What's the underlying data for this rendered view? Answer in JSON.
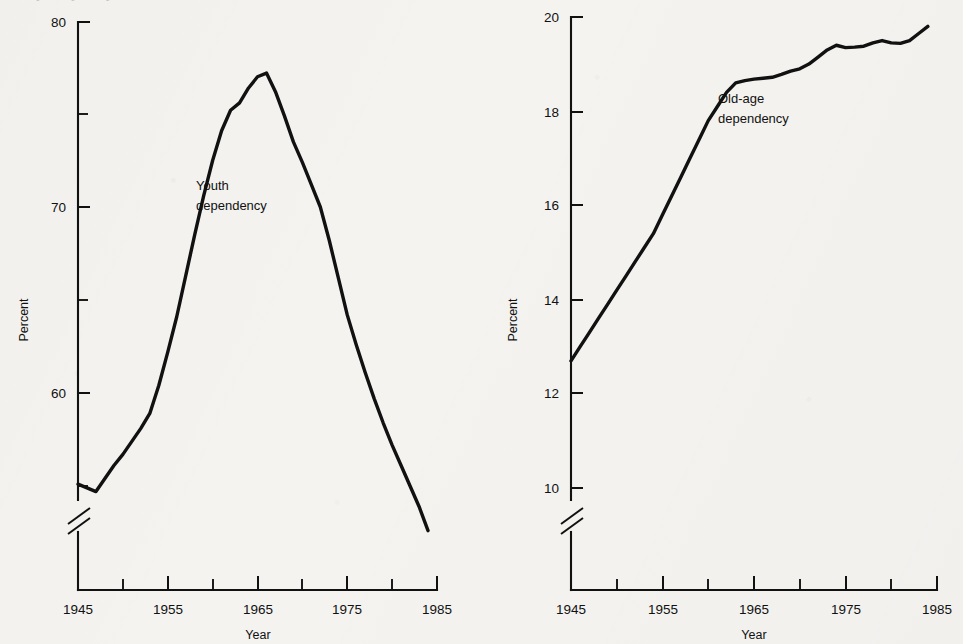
{
  "figure": {
    "cropped_top_text": "● ● ●",
    "background_color": "#f4f3f0",
    "ink_color": "#111111"
  },
  "chart_data": [
    {
      "type": "line",
      "panel_id": "youth",
      "title": "",
      "xlabel": "Year",
      "ylabel": "Percent",
      "legend_position": "inline-annotation",
      "grid": false,
      "axis_break": true,
      "axis_break_note": "y-axis broken below 55",
      "xlim": [
        1945,
        1985
      ],
      "ylim": [
        54,
        80
      ],
      "ytick_major": [
        60,
        70,
        80
      ],
      "ytick_minor": [
        55,
        65,
        75
      ],
      "xtick_major": [
        1945,
        1955,
        1965,
        1975,
        1985
      ],
      "xtick_minor": [
        1950,
        1960,
        1970,
        1980
      ],
      "series": [
        {
          "name": "Youth dependency",
          "annotation": "Youth\ndependency",
          "annotation_line1": "Youth",
          "annotation_line2": "dependency",
          "x": [
            1945,
            1946,
            1947,
            1948,
            1949,
            1950,
            1951,
            1952,
            1953,
            1954,
            1955,
            1956,
            1957,
            1958,
            1959,
            1960,
            1961,
            1962,
            1963,
            1964,
            1965,
            1966,
            1967,
            1968,
            1969,
            1970,
            1971,
            1972,
            1973,
            1974,
            1975,
            1976,
            1977,
            1978,
            1979,
            1980,
            1981,
            1982,
            1983,
            1984
          ],
          "values": [
            55.1,
            54.9,
            54.7,
            55.4,
            56.1,
            56.7,
            57.4,
            58.1,
            58.9,
            60.4,
            62.2,
            64.1,
            66.3,
            68.5,
            70.6,
            72.5,
            74.1,
            75.2,
            75.6,
            76.4,
            77.0,
            77.2,
            76.2,
            74.9,
            73.5,
            72.4,
            71.2,
            70.0,
            68.2,
            66.2,
            64.2,
            62.6,
            61.1,
            59.7,
            58.4,
            57.2,
            56.1,
            55.0,
            53.9,
            52.6
          ]
        }
      ]
    },
    {
      "type": "line",
      "panel_id": "oldage",
      "title": "",
      "xlabel": "Year",
      "ylabel": "Percent",
      "legend_position": "inline-annotation",
      "grid": false,
      "axis_break": true,
      "axis_break_note": "y-axis broken below 10",
      "xlim": [
        1945,
        1985
      ],
      "ylim": [
        9.4,
        20
      ],
      "ytick_major": [
        10,
        12,
        14,
        16,
        18,
        20
      ],
      "ytick_minor": [
        11,
        13,
        15,
        17,
        19
      ],
      "xtick_major": [
        1945,
        1955,
        1965,
        1975,
        1985
      ],
      "xtick_minor": [
        1950,
        1960,
        1970,
        1980
      ],
      "series": [
        {
          "name": "Old-age dependency",
          "annotation": "Old-age\ndependency",
          "annotation_line1": "Old-age",
          "annotation_line2": "dependency",
          "x": [
            1945,
            1946,
            1947,
            1948,
            1949,
            1950,
            1951,
            1952,
            1953,
            1954,
            1955,
            1956,
            1957,
            1958,
            1959,
            1960,
            1961,
            1962,
            1963,
            1964,
            1965,
            1966,
            1967,
            1968,
            1969,
            1970,
            1971,
            1972,
            1973,
            1974,
            1975,
            1976,
            1977,
            1978,
            1979,
            1980,
            1981,
            1982,
            1983,
            1984
          ],
          "values": [
            12.7,
            13.0,
            13.3,
            13.6,
            13.9,
            14.2,
            14.5,
            14.8,
            15.1,
            15.4,
            15.8,
            16.2,
            16.6,
            17.0,
            17.4,
            17.8,
            18.1,
            18.4,
            18.6,
            18.65,
            18.68,
            18.7,
            18.72,
            18.78,
            18.85,
            18.9,
            19.0,
            19.15,
            19.3,
            19.4,
            19.35,
            19.36,
            19.38,
            19.45,
            19.5,
            19.45,
            19.44,
            19.5,
            19.65,
            19.8
          ]
        }
      ]
    }
  ],
  "panels": {
    "youth": {
      "ylabel": "Percent",
      "xlabel": "Year",
      "annotation_line1": "Youth",
      "annotation_line2": "dependency",
      "ytick_labels": [
        "80",
        "70",
        "60"
      ],
      "xtick_labels": [
        "1945",
        "1955",
        "1965",
        "1975",
        "1985"
      ]
    },
    "oldage": {
      "ylabel": "Percent",
      "xlabel": "Year",
      "annotation_line1": "Old-age",
      "annotation_line2": "dependency",
      "ytick_labels": [
        "20",
        "18",
        "16",
        "14",
        "12",
        "10"
      ],
      "xtick_labels": [
        "1945",
        "1955",
        "1965",
        "1975",
        "1985"
      ]
    }
  }
}
